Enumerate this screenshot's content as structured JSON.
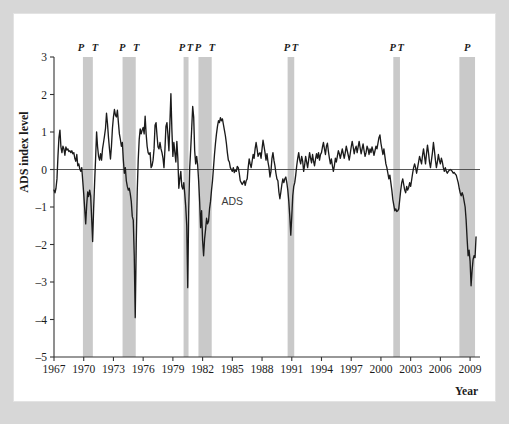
{
  "figure": {
    "background_color": "#d7d7d7",
    "panel_color": "#ffffff",
    "series_color": "#1b1b1b",
    "band_color": "#c9c9c9"
  },
  "chart_data": {
    "type": "line",
    "title": "",
    "xlabel": "Year",
    "ylabel": "ADS index level",
    "xlim": [
      1967.0,
      2010.0
    ],
    "ylim": [
      -5,
      3
    ],
    "grid": false,
    "legend_position": "inline-annotation",
    "xticks": [
      1967,
      1970,
      1973,
      1976,
      1979,
      1982,
      1985,
      1988,
      1991,
      1994,
      1997,
      2000,
      2003,
      2006,
      2009
    ],
    "yticks": [
      3,
      2,
      1,
      0,
      -1,
      -2,
      -3,
      -4,
      -5
    ],
    "annotations": [
      {
        "text": "ADS",
        "x": 1985.0,
        "y": -0.95
      }
    ],
    "recession_bands": [
      {
        "start": 1969.92,
        "end": 1970.92,
        "peak_label": "P",
        "trough_label": "T"
      },
      {
        "start": 1973.92,
        "end": 1975.25,
        "peak_label": "P",
        "trough_label": "T"
      },
      {
        "start": 1980.08,
        "end": 1980.58,
        "peak_label": "P",
        "trough_label": "T"
      },
      {
        "start": 1981.58,
        "end": 1982.92,
        "peak_label": "P",
        "trough_label": "T"
      },
      {
        "start": 1990.58,
        "end": 1991.25,
        "peak_label": "P",
        "trough_label": "T"
      },
      {
        "start": 2001.25,
        "end": 2001.92,
        "peak_label": "P",
        "trough_label": "T"
      },
      {
        "start": 2007.92,
        "end": 2009.5,
        "peak_label": "P",
        "trough_label": ""
      }
    ],
    "series": [
      {
        "name": "ADS",
        "x": [
          1967.0,
          1967.1,
          1967.2,
          1967.3,
          1967.4,
          1967.5,
          1967.6,
          1967.7,
          1967.8,
          1967.9,
          1968.0,
          1968.1,
          1968.2,
          1968.3,
          1968.4,
          1968.5,
          1968.6,
          1968.7,
          1968.8,
          1968.9,
          1969.0,
          1969.1,
          1969.2,
          1969.3,
          1969.4,
          1969.5,
          1969.6,
          1969.7,
          1969.8,
          1969.9,
          1970.0,
          1970.1,
          1970.2,
          1970.3,
          1970.4,
          1970.5,
          1970.6,
          1970.7,
          1970.8,
          1970.9,
          1971.0,
          1971.1,
          1971.2,
          1971.3,
          1971.4,
          1971.5,
          1971.6,
          1971.7,
          1971.8,
          1971.9,
          1972.0,
          1972.1,
          1972.2,
          1972.3,
          1972.4,
          1972.5,
          1972.6,
          1972.7,
          1972.8,
          1972.9,
          1973.0,
          1973.1,
          1973.2,
          1973.3,
          1973.4,
          1973.5,
          1973.6,
          1973.7,
          1973.8,
          1973.9,
          1974.0,
          1974.1,
          1974.2,
          1974.3,
          1974.4,
          1974.5,
          1974.6,
          1974.7,
          1974.8,
          1974.9,
          1975.0,
          1975.1,
          1975.2,
          1975.3,
          1975.4,
          1975.5,
          1975.6,
          1975.7,
          1975.8,
          1975.9,
          1976.0,
          1976.1,
          1976.2,
          1976.3,
          1976.4,
          1976.5,
          1976.6,
          1976.7,
          1976.8,
          1976.9,
          1977.0,
          1977.1,
          1977.2,
          1977.3,
          1977.4,
          1977.5,
          1977.6,
          1977.7,
          1977.8,
          1977.9,
          1978.0,
          1978.1,
          1978.2,
          1978.3,
          1978.4,
          1978.5,
          1978.6,
          1978.7,
          1978.8,
          1978.9,
          1979.0,
          1979.1,
          1979.2,
          1979.3,
          1979.4,
          1979.5,
          1979.6,
          1979.7,
          1979.8,
          1979.9,
          1980.0,
          1980.1,
          1980.2,
          1980.3,
          1980.4,
          1980.5,
          1980.6,
          1980.7,
          1980.8,
          1980.9,
          1981.0,
          1981.1,
          1981.2,
          1981.3,
          1981.4,
          1981.5,
          1981.6,
          1981.7,
          1981.8,
          1981.9,
          1982.0,
          1982.1,
          1982.2,
          1982.3,
          1982.4,
          1982.5,
          1982.6,
          1982.7,
          1982.8,
          1982.9,
          1983.0,
          1983.1,
          1983.2,
          1983.3,
          1983.4,
          1983.5,
          1983.6,
          1983.7,
          1983.8,
          1983.9,
          1984.0,
          1984.1,
          1984.2,
          1984.3,
          1984.4,
          1984.5,
          1984.6,
          1984.7,
          1984.8,
          1984.9,
          1985.0,
          1985.1,
          1985.2,
          1985.3,
          1985.4,
          1985.5,
          1985.6,
          1985.7,
          1985.8,
          1985.9,
          1986.0,
          1986.1,
          1986.2,
          1986.3,
          1986.4,
          1986.5,
          1986.6,
          1986.7,
          1986.8,
          1986.9,
          1987.0,
          1987.1,
          1987.2,
          1987.3,
          1987.4,
          1987.5,
          1987.6,
          1987.7,
          1987.8,
          1987.9,
          1988.0,
          1988.1,
          1988.2,
          1988.3,
          1988.4,
          1988.5,
          1988.6,
          1988.7,
          1988.8,
          1988.9,
          1989.0,
          1989.1,
          1989.2,
          1989.3,
          1989.4,
          1989.5,
          1989.6,
          1989.7,
          1989.8,
          1989.9,
          1990.0,
          1990.1,
          1990.2,
          1990.3,
          1990.4,
          1990.5,
          1990.6,
          1990.7,
          1990.8,
          1990.9,
          1991.0,
          1991.1,
          1991.2,
          1991.3,
          1991.4,
          1991.5,
          1991.6,
          1991.7,
          1991.8,
          1991.9,
          1992.0,
          1992.1,
          1992.2,
          1992.3,
          1992.4,
          1992.5,
          1992.6,
          1992.7,
          1992.8,
          1992.9,
          1993.0,
          1993.1,
          1993.2,
          1993.3,
          1993.4,
          1993.5,
          1993.6,
          1993.7,
          1993.8,
          1993.9,
          1994.0,
          1994.1,
          1994.2,
          1994.3,
          1994.4,
          1994.5,
          1994.6,
          1994.7,
          1994.8,
          1994.9,
          1995.0,
          1995.1,
          1995.2,
          1995.3,
          1995.4,
          1995.5,
          1995.6,
          1995.7,
          1995.8,
          1995.9,
          1996.0,
          1996.1,
          1996.2,
          1996.3,
          1996.4,
          1996.5,
          1996.6,
          1996.7,
          1996.8,
          1996.9,
          1997.0,
          1997.1,
          1997.2,
          1997.3,
          1997.4,
          1997.5,
          1997.6,
          1997.7,
          1997.8,
          1997.9,
          1998.0,
          1998.1,
          1998.2,
          1998.3,
          1998.4,
          1998.5,
          1998.6,
          1998.7,
          1998.8,
          1998.9,
          1999.0,
          1999.1,
          1999.2,
          1999.3,
          1999.4,
          1999.5,
          1999.6,
          1999.7,
          1999.8,
          1999.9,
          2000.0,
          2000.1,
          2000.2,
          2000.3,
          2000.4,
          2000.5,
          2000.6,
          2000.7,
          2000.8,
          2000.9,
          2001.0,
          2001.1,
          2001.2,
          2001.3,
          2001.4,
          2001.5,
          2001.6,
          2001.7,
          2001.8,
          2001.9,
          2002.0,
          2002.1,
          2002.2,
          2002.3,
          2002.4,
          2002.5,
          2002.6,
          2002.7,
          2002.8,
          2002.9,
          2003.0,
          2003.1,
          2003.2,
          2003.3,
          2003.4,
          2003.5,
          2003.6,
          2003.7,
          2003.8,
          2003.9,
          2004.0,
          2004.1,
          2004.2,
          2004.3,
          2004.4,
          2004.5,
          2004.6,
          2004.7,
          2004.8,
          2004.9,
          2005.0,
          2005.1,
          2005.2,
          2005.3,
          2005.4,
          2005.5,
          2005.6,
          2005.7,
          2005.8,
          2005.9,
          2006.0,
          2006.1,
          2006.2,
          2006.3,
          2006.4,
          2006.5,
          2006.6,
          2006.7,
          2006.8,
          2006.9,
          2007.0,
          2007.1,
          2007.2,
          2007.3,
          2007.4,
          2007.5,
          2007.6,
          2007.7,
          2007.8,
          2007.9,
          2008.0,
          2008.1,
          2008.2,
          2008.3,
          2008.4,
          2008.5,
          2008.6,
          2008.7,
          2008.8,
          2008.9,
          2009.0,
          2009.1,
          2009.2,
          2009.3,
          2009.4,
          2009.5,
          2009.6
        ],
        "values": [
          -0.55,
          -0.62,
          -0.5,
          -0.25,
          0.35,
          0.85,
          1.05,
          0.6,
          0.45,
          0.62,
          0.55,
          0.38,
          0.6,
          0.52,
          0.55,
          0.48,
          0.5,
          0.45,
          0.5,
          0.42,
          0.45,
          0.3,
          0.22,
          0.4,
          0.1,
          0.15,
          0.02,
          -0.05,
          0.05,
          -0.3,
          -0.65,
          -1.05,
          -1.45,
          -0.95,
          -0.6,
          -0.72,
          -0.55,
          -0.7,
          -1.3,
          -1.92,
          -1.05,
          -0.35,
          0.3,
          1.0,
          0.6,
          0.35,
          0.25,
          0.42,
          0.25,
          0.55,
          0.72,
          0.9,
          1.1,
          1.5,
          1.22,
          0.85,
          0.55,
          0.28,
          0.62,
          1.1,
          1.4,
          1.6,
          1.45,
          1.4,
          1.58,
          1.25,
          0.95,
          0.8,
          0.62,
          0.72,
          0.25,
          -0.1,
          0.05,
          -0.3,
          -0.45,
          -0.55,
          -0.5,
          -0.65,
          -0.85,
          -1.25,
          -1.35,
          -2.3,
          -3.95,
          -2.0,
          -0.6,
          0.25,
          0.8,
          1.08,
          0.95,
          1.05,
          1.12,
          0.95,
          1.42,
          0.95,
          0.62,
          0.45,
          0.4,
          0.45,
          0.05,
          0.1,
          0.25,
          0.55,
          1.18,
          1.25,
          0.9,
          0.6,
          0.55,
          0.72,
          0.55,
          0.45,
          0.3,
          0.05,
          0.55,
          1.15,
          1.25,
          0.92,
          0.5,
          1.25,
          2.02,
          1.05,
          0.35,
          0.72,
          0.45,
          0.2,
          0.75,
          0.3,
          -0.5,
          -0.25,
          -0.05,
          -0.45,
          -0.52,
          -0.35,
          -0.65,
          -1.0,
          -1.5,
          -3.15,
          -1.05,
          0.05,
          0.55,
          1.1,
          1.68,
          1.4,
          0.5,
          0.15,
          0.35,
          0.12,
          -0.3,
          -0.85,
          -1.55,
          -1.1,
          -1.9,
          -2.3,
          -1.85,
          -1.6,
          -1.3,
          -1.45,
          -1.38,
          -1.05,
          -0.85,
          -0.55,
          -0.3,
          0.05,
          0.4,
          0.7,
          0.95,
          1.15,
          1.3,
          1.25,
          1.38,
          1.3,
          1.35,
          1.2,
          1.05,
          0.9,
          0.7,
          0.45,
          0.25,
          0.2,
          0.05,
          0.0,
          -0.05,
          0.05,
          -0.08,
          -0.02,
          -0.05,
          0.08,
          0.05,
          -0.1,
          -0.3,
          -0.35,
          -0.4,
          -0.35,
          -0.3,
          -0.42,
          -0.3,
          -0.25,
          0.05,
          0.28,
          0.15,
          0.05,
          0.22,
          0.4,
          0.3,
          0.55,
          0.72,
          0.55,
          0.35,
          0.42,
          0.45,
          0.3,
          0.55,
          0.78,
          0.62,
          0.45,
          0.25,
          0.42,
          0.2,
          0.05,
          -0.2,
          -0.05,
          0.3,
          0.45,
          0.25,
          0.1,
          -0.1,
          -0.25,
          -0.3,
          -0.6,
          -0.78,
          -0.6,
          -0.4,
          -0.25,
          -0.35,
          -0.25,
          -0.2,
          -0.35,
          -0.55,
          -0.85,
          -1.25,
          -1.75,
          -1.25,
          -0.7,
          -0.45,
          -0.35,
          -0.15,
          0.1,
          0.3,
          0.45,
          0.25,
          0.15,
          0.35,
          0.22,
          -0.05,
          0.12,
          0.35,
          0.2,
          0.05,
          0.25,
          0.45,
          0.3,
          0.18,
          0.4,
          0.22,
          0.1,
          0.28,
          0.42,
          0.3,
          0.45,
          0.25,
          0.4,
          0.45,
          0.6,
          0.72,
          0.55,
          0.4,
          0.62,
          0.7,
          0.48,
          0.3,
          0.15,
          0.28,
          0.1,
          -0.05,
          0.1,
          0.3,
          0.2,
          0.35,
          0.5,
          0.42,
          0.3,
          0.42,
          0.55,
          0.42,
          0.3,
          0.45,
          0.62,
          0.5,
          0.38,
          0.25,
          0.42,
          0.6,
          0.75,
          0.6,
          0.42,
          0.55,
          0.62,
          0.45,
          0.6,
          0.75,
          0.58,
          0.42,
          0.55,
          0.68,
          0.5,
          0.35,
          0.45,
          0.62,
          0.55,
          0.4,
          0.55,
          0.45,
          0.6,
          0.5,
          0.38,
          0.5,
          0.62,
          0.55,
          0.7,
          0.85,
          0.92,
          0.7,
          0.55,
          0.4,
          0.55,
          0.35,
          0.15,
          0.05,
          -0.1,
          -0.25,
          -0.15,
          -0.35,
          -0.55,
          -0.8,
          -0.95,
          -1.1,
          -1.05,
          -1.12,
          -1.1,
          -1.05,
          -0.8,
          -0.55,
          -0.35,
          -0.25,
          -0.4,
          -0.55,
          -0.62,
          -0.45,
          -0.55,
          -0.48,
          -0.35,
          -0.45,
          -0.28,
          -0.1,
          0.05,
          0.15,
          0.05,
          -0.1,
          0.05,
          0.2,
          0.35,
          0.25,
          0.15,
          0.38,
          0.55,
          0.35,
          0.15,
          0.42,
          0.65,
          0.45,
          0.2,
          0.05,
          0.25,
          0.45,
          0.72,
          0.5,
          0.25,
          0.05,
          0.2,
          0.4,
          0.25,
          0.15,
          0.3,
          0.2,
          0.05,
          -0.05,
          0.05,
          -0.05,
          -0.1,
          -0.05,
          -0.02,
          0.0,
          -0.02,
          -0.05,
          -0.1,
          -0.08,
          -0.12,
          -0.15,
          -0.25,
          -0.35,
          -0.5,
          -0.62,
          -0.7,
          -0.62,
          -0.7,
          -0.85,
          -1.0,
          -1.35,
          -1.85,
          -2.3,
          -2.15,
          -2.45,
          -3.1,
          -2.7,
          -2.4,
          -2.3,
          -2.35,
          -1.8
        ]
      }
    ]
  },
  "axes": {
    "y_title": "ADS index level",
    "x_title": "Year",
    "y_tick_labels": [
      "3",
      "2",
      "1",
      "0",
      "–1",
      "–2",
      "–3",
      "–4",
      "–5"
    ],
    "x_tick_labels": [
      "1967",
      "1970",
      "1973",
      "1976",
      "1979",
      "1982",
      "1985",
      "1988",
      "1991",
      "1994",
      "1997",
      "2000",
      "2003",
      "2006",
      "2009"
    ]
  },
  "band_labels": [
    {
      "peak": "P",
      "trough": "T"
    },
    {
      "peak": "P",
      "trough": "T"
    },
    {
      "peak": "P",
      "trough": "T"
    },
    {
      "peak": "P",
      "trough": "T"
    },
    {
      "peak": "P",
      "trough": "T"
    },
    {
      "peak": "P",
      "trough": "T"
    },
    {
      "peak": "P",
      "trough": ""
    }
  ],
  "series_annotation": "ADS"
}
